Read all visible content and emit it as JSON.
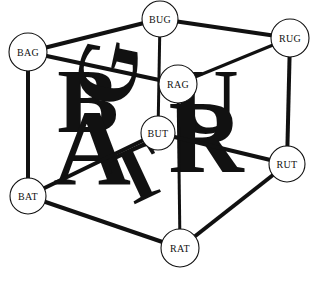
{
  "diagram": {
    "type": "cube-graph",
    "canvas": {
      "width": 317,
      "height": 281
    },
    "colors": {
      "background": "#ffffff",
      "stroke": "#111111",
      "node_fill": "#ffffff",
      "letter_fill": "#111111"
    },
    "nodes": [
      {
        "id": "BAG",
        "label": "BAG",
        "cx": 28,
        "cy": 52,
        "r": 19
      },
      {
        "id": "BUG",
        "label": "BUG",
        "cx": 160,
        "cy": 19,
        "r": 18
      },
      {
        "id": "RUG",
        "label": "RUG",
        "cx": 290,
        "cy": 38,
        "r": 19
      },
      {
        "id": "RAG",
        "label": "RAG",
        "cx": 178,
        "cy": 84,
        "r": 19
      },
      {
        "id": "BUT",
        "label": "BUT",
        "cx": 158,
        "cy": 133,
        "r": 17
      },
      {
        "id": "BAT",
        "label": "BAT",
        "cx": 28,
        "cy": 196,
        "r": 18
      },
      {
        "id": "RUT",
        "label": "RUT",
        "cx": 287,
        "cy": 164,
        "r": 18
      },
      {
        "id": "RAT",
        "label": "RAT",
        "cx": 180,
        "cy": 248,
        "r": 19
      }
    ],
    "edges": [
      {
        "from": "BAG",
        "to": "BUG",
        "width": 4
      },
      {
        "from": "BUG",
        "to": "RUG",
        "width": 4
      },
      {
        "from": "BAG",
        "to": "RAG",
        "width": 4
      },
      {
        "from": "RAG",
        "to": "RUG",
        "width": 3
      },
      {
        "from": "BAG",
        "to": "BAT",
        "width": 4
      },
      {
        "from": "BUG",
        "to": "BUT",
        "width": 3
      },
      {
        "from": "RUG",
        "to": "RUT",
        "width": 4
      },
      {
        "from": "RAG",
        "to": "RAT",
        "width": 3
      },
      {
        "from": "BAT",
        "to": "BUT",
        "width": 4
      },
      {
        "from": "BUT",
        "to": "RUT",
        "width": 4
      },
      {
        "from": "BAT",
        "to": "RAT",
        "width": 4
      },
      {
        "from": "RAT",
        "to": "RUT",
        "width": 4
      }
    ],
    "background_letters": [
      {
        "char": "B",
        "x": 88,
        "y": 132,
        "size": 92,
        "rotate": 0,
        "skew": 0
      },
      {
        "char": "A",
        "x": 92,
        "y": 185,
        "size": 108,
        "rotate": 0,
        "skew": 0
      },
      {
        "char": "G",
        "x": 135,
        "y": 78,
        "size": 86,
        "rotate": -78,
        "skew": 0
      },
      {
        "char": "U",
        "x": 205,
        "y": 133,
        "size": 94,
        "rotate": 0,
        "skew": 0
      },
      {
        "char": "R",
        "x": 206,
        "y": 172,
        "size": 104,
        "rotate": 0,
        "skew": 0
      },
      {
        "char": "T",
        "x": 148,
        "y": 198,
        "size": 80,
        "rotate": -25,
        "skew": 0
      }
    ]
  }
}
